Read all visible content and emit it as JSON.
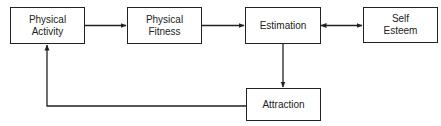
{
  "diagram": {
    "nodes": [
      {
        "id": "physical-activity",
        "label_line1": "Physical",
        "label_line2": "Activity"
      },
      {
        "id": "physical-fitness",
        "label_line1": "Physical",
        "label_line2": "Fitness"
      },
      {
        "id": "estimation",
        "label_line1": "Estimation",
        "label_line2": ""
      },
      {
        "id": "self-esteem",
        "label_line1": "Self",
        "label_line2": "Esteem"
      },
      {
        "id": "attraction",
        "label_line1": "Attraction",
        "label_line2": ""
      }
    ],
    "edges": [
      {
        "from": "physical-activity",
        "to": "physical-fitness",
        "type": "directed"
      },
      {
        "from": "physical-fitness",
        "to": "estimation",
        "type": "directed"
      },
      {
        "from": "estimation",
        "to": "self-esteem",
        "type": "bidirectional"
      },
      {
        "from": "estimation",
        "to": "attraction",
        "type": "directed"
      },
      {
        "from": "attraction",
        "to": "physical-activity",
        "type": "directed"
      }
    ],
    "colors": {
      "line": "#222222",
      "background": "#ffffff"
    }
  }
}
